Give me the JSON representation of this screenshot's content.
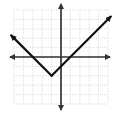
{
  "chart_data": {
    "type": "line",
    "title": "",
    "xlabel": "",
    "ylabel": "",
    "function": "y = |x + 1| - 2",
    "xlim": [
      -5,
      5
    ],
    "ylim": [
      -5,
      5
    ],
    "grid": true,
    "vertex": {
      "x": -1,
      "y": -2
    },
    "series": [
      {
        "name": "absolute-value-graph",
        "x": [
          -5.3,
          -1,
          5.3
        ],
        "y": [
          2.3,
          -2,
          4.3
        ],
        "arrows": "both-ends"
      }
    ],
    "colors": {
      "grid": "#c8c8c8",
      "axis": "#333333",
      "line": "#111111"
    }
  }
}
